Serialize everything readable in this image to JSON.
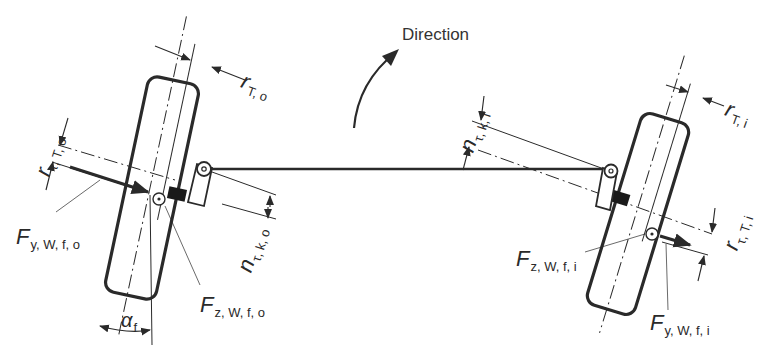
{
  "title": "Direction",
  "colors": {
    "ink": "#2a2a2a",
    "background": "#ffffff",
    "hatch": "#1a1a1a"
  },
  "labels": {
    "direction": "Direction",
    "r_T_o": {
      "main": "r",
      "sub": "T, o"
    },
    "r_T_i": {
      "main": "r",
      "sub": "T, i"
    },
    "r_tau_T_o": {
      "main": "r",
      "sub": "τ, T, o"
    },
    "r_tau_T_i": {
      "main": "r",
      "sub": "τ, T, i"
    },
    "n_tau_k_o": {
      "main": "n",
      "sub": "τ, k, o"
    },
    "n_tau_k_i": {
      "main": "n",
      "sub": "τ, k, i"
    },
    "F_y_W_f_o": {
      "main": "F",
      "sub": "y, W, f, o"
    },
    "F_z_W_f_o": {
      "main": "F",
      "sub": "z, W, f, o"
    },
    "F_z_W_f_i": {
      "main": "F",
      "sub": "z, W, f, i"
    },
    "F_y_W_f_i": {
      "main": "F",
      "sub": "y, W, f, i"
    },
    "alpha_f": {
      "main": "α",
      "sub": "f"
    }
  },
  "components": [
    "outer-wheel",
    "inner-wheel",
    "tie-rod",
    "steering-arm-outer",
    "steering-arm-inner",
    "direction-arrow"
  ]
}
